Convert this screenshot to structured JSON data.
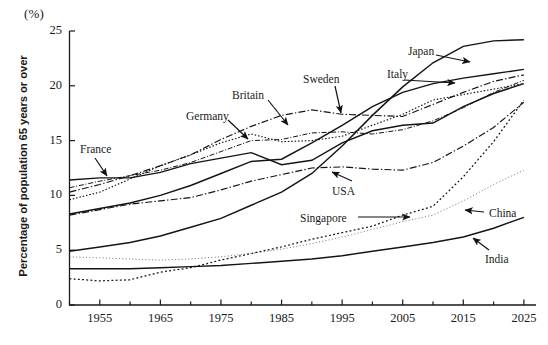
{
  "chart_data": {
    "type": "line",
    "title": "",
    "unit_label": "(%)",
    "ylabel": "Percentage of  population 65 years or over",
    "xlabel": "",
    "xlim": [
      1950,
      2027
    ],
    "ylim": [
      0,
      25
    ],
    "yticks": [
      0,
      5,
      10,
      15,
      20,
      25
    ],
    "xticks": [
      1955,
      1965,
      1975,
      1985,
      1995,
      2005,
      2015,
      2025
    ],
    "grid": false,
    "legend": "inline-annotations",
    "x": [
      1950,
      1955,
      1960,
      1965,
      1970,
      1975,
      1980,
      1985,
      1990,
      1995,
      2000,
      2005,
      2010,
      2015,
      2020,
      2025
    ],
    "series": [
      {
        "name": "Japan",
        "style": "solid",
        "values": [
          4.9,
          5.3,
          5.7,
          6.3,
          7.1,
          7.9,
          9.1,
          10.3,
          12.0,
          14.5,
          17.3,
          19.9,
          22.1,
          23.6,
          24.1,
          24.2
        ]
      },
      {
        "name": "Italy",
        "style": "solid",
        "values": [
          8.3,
          8.8,
          9.3,
          10.0,
          10.9,
          12.0,
          13.1,
          13.3,
          14.8,
          16.4,
          18.1,
          19.4,
          20.2,
          20.7,
          21.1,
          21.5
        ]
      },
      {
        "name": "Sweden",
        "style": "dash-dot",
        "values": [
          10.3,
          11.0,
          11.8,
          12.7,
          13.7,
          15.1,
          16.3,
          17.3,
          17.8,
          17.4,
          17.3,
          17.2,
          18.3,
          19.4,
          20.4,
          21.0
        ]
      },
      {
        "name": "Britain",
        "style": "dash-dot-fine",
        "values": [
          10.7,
          11.3,
          11.8,
          12.3,
          13.0,
          14.0,
          15.0,
          15.1,
          15.7,
          15.8,
          15.6,
          16.0,
          16.8,
          18.0,
          19.4,
          20.5
        ]
      },
      {
        "name": "Germany",
        "style": "dotted",
        "values": [
          9.6,
          10.3,
          11.5,
          12.7,
          13.7,
          14.8,
          15.6,
          14.9,
          15.0,
          15.4,
          16.4,
          17.4,
          18.7,
          19.2,
          19.7,
          20.2
        ]
      },
      {
        "name": "France",
        "style": "solid-zigzag",
        "values": [
          11.4,
          11.6,
          11.6,
          12.1,
          12.9,
          13.4,
          13.9,
          12.8,
          13.2,
          14.8,
          15.9,
          16.4,
          16.6,
          18.1,
          19.3,
          20.2
        ]
      },
      {
        "name": "USA",
        "style": "dash-dot",
        "values": [
          8.2,
          8.7,
          9.2,
          9.5,
          9.8,
          10.5,
          11.3,
          11.9,
          12.5,
          12.6,
          12.4,
          12.3,
          13.0,
          14.5,
          16.2,
          18.5
        ]
      },
      {
        "name": "Singapore",
        "style": "dotted-coarse",
        "values": [
          2.4,
          2.2,
          2.3,
          3.0,
          3.4,
          4.1,
          4.7,
          5.3,
          6.0,
          6.6,
          7.2,
          8.2,
          9.0,
          11.7,
          14.9,
          18.7
        ]
      },
      {
        "name": "China",
        "style": "dotted-fine",
        "values": [
          4.4,
          4.3,
          4.2,
          4.1,
          4.2,
          4.4,
          4.7,
          5.1,
          5.6,
          6.2,
          6.9,
          7.6,
          8.2,
          9.5,
          11.0,
          12.3
        ]
      },
      {
        "name": "India",
        "style": "solid",
        "values": [
          3.3,
          3.3,
          3.3,
          3.4,
          3.5,
          3.6,
          3.8,
          4.0,
          4.2,
          4.5,
          4.9,
          5.3,
          5.7,
          6.2,
          7.0,
          8.0
        ]
      }
    ],
    "annotations": [
      {
        "label": "France",
        "x": 80,
        "y": 143
      },
      {
        "label": "Germany",
        "x": 186,
        "y": 110
      },
      {
        "label": "Britain",
        "x": 232,
        "y": 89
      },
      {
        "label": "Sweden",
        "x": 303,
        "y": 73
      },
      {
        "label": "Italy",
        "x": 387,
        "y": 68
      },
      {
        "label": "Japan",
        "x": 408,
        "y": 45
      },
      {
        "label": "USA",
        "x": 332,
        "y": 185
      },
      {
        "label": "Singapore",
        "x": 300,
        "y": 212
      },
      {
        "label": "China",
        "x": 489,
        "y": 207
      },
      {
        "label": "India",
        "x": 485,
        "y": 253
      }
    ]
  },
  "axis": {
    "ytick_labels": [
      "0",
      "5",
      "10",
      "15",
      "20",
      "25"
    ],
    "xtick_labels": [
      "1955",
      "1965",
      "1975",
      "1985",
      "1995",
      "2005",
      "2015",
      "2025"
    ]
  }
}
